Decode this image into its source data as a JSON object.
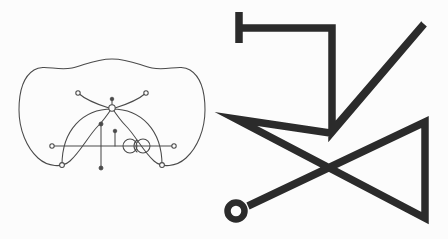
{
  "page": {
    "width": 448,
    "height": 239,
    "background_color": "#fcfcfc"
  },
  "colors": {
    "thin_stroke": "#4a4a4a",
    "bold_stroke": "#2b2b2b",
    "node_fill": "#fcfcfc"
  },
  "figures": [
    {
      "id": "left-figure",
      "name": "blob-with-inner-curves",
      "description": "Thin-line peanut-shaped closed blob containing inner arcs, a horizontal axis line, vertical ticks, small endpoint nodes and a double-loop spiral detail",
      "stroke_color": "#4a4a4a",
      "stroke_width": 1.05,
      "paths": {
        "blob_outline": "M 112 59 C 130 59 141 66 152 68 C 168 71 180 64 190 70 C 203 78 205 95 205 110 C 205 130 197 148 186 158 C 176 167 162 168 154 161 C 143 151 135 135 126 126 C 120 120 116 114 112 108 C 108 114 104 120 98 126 C 89 135 81 151 70 161 C 62 168 48 167 38 158 C 27 148 19 130 19 110 C 19 95 21 78 34 70 C 44 64 56 71 72 68 C 83 66 94 59 112 59 Z",
        "upper_left_curve": "M 78 93 C 86 100 96 104 109 108",
        "upper_right_curve": "M 146 93 C 138 100 128 104 115 108",
        "big_arc": "M 62 165 C 62 130 83 109 112 109 C 141 109 162 130 162 165",
        "axis_line": "M 52 146 L 174 146",
        "vertical_tick_long": "M 101 124 L 101 168",
        "vertical_tick_short": "M 115 131 L 115 146",
        "apex_stem": "M 112 99 L 112 108",
        "loop_left": "M 130 146 m -7,0 a 7,7 0 1,0 14,0 a 7,7 0 1,0 -14,0",
        "loop_right": "M 143 146 m -7,0 a 7,7 0 1,0 14,0 a 7,7 0 1,0 -14,0",
        "spiral_connector": "M 137 140 C 133 143 133 149 137 152"
      },
      "nodes": [
        {
          "name": "node-upper-left-endpoint",
          "x": 78,
          "y": 93,
          "r": 2.2
        },
        {
          "name": "node-upper-right-endpoint",
          "x": 146,
          "y": 93,
          "r": 2.2
        },
        {
          "name": "node-apex-stem-top",
          "x": 112,
          "y": 99,
          "r": 1.8
        },
        {
          "name": "node-apex-circle",
          "x": 112,
          "y": 108,
          "r": 3.2
        },
        {
          "name": "node-arc-left-foot",
          "x": 62,
          "y": 165,
          "r": 2.4
        },
        {
          "name": "node-arc-right-foot",
          "x": 162,
          "y": 165,
          "r": 2.4
        },
        {
          "name": "node-axis-left-end",
          "x": 52,
          "y": 146,
          "r": 2.2
        },
        {
          "name": "node-axis-right-end",
          "x": 174,
          "y": 146,
          "r": 2.2
        },
        {
          "name": "node-tick-long-top",
          "x": 101,
          "y": 124,
          "r": 2.0
        },
        {
          "name": "node-tick-long-bottom",
          "x": 101,
          "y": 168,
          "r": 2.0
        },
        {
          "name": "node-tick-short-top",
          "x": 115,
          "y": 131,
          "r": 1.8
        }
      ]
    },
    {
      "id": "right-figure",
      "name": "zigzag-polyline-with-ring",
      "description": "Bold black self-crossing zigzag polyline, starting with a short vertical stub at top-left and ending in a small open ring at bottom-left",
      "stroke_color": "#2b2b2b",
      "stroke_width": 7.5,
      "paths": {
        "stub": "M 239 12 L 239 43",
        "polyline": "M 239 28 L 332 28 L 332 132 L 424 24 L 330 133 L 236 119 L 425 218 L 425 122 L 248 206"
      },
      "ring": {
        "name": "end-ring",
        "cx": 236,
        "cy": 211,
        "r": 8.5
      }
    }
  ]
}
